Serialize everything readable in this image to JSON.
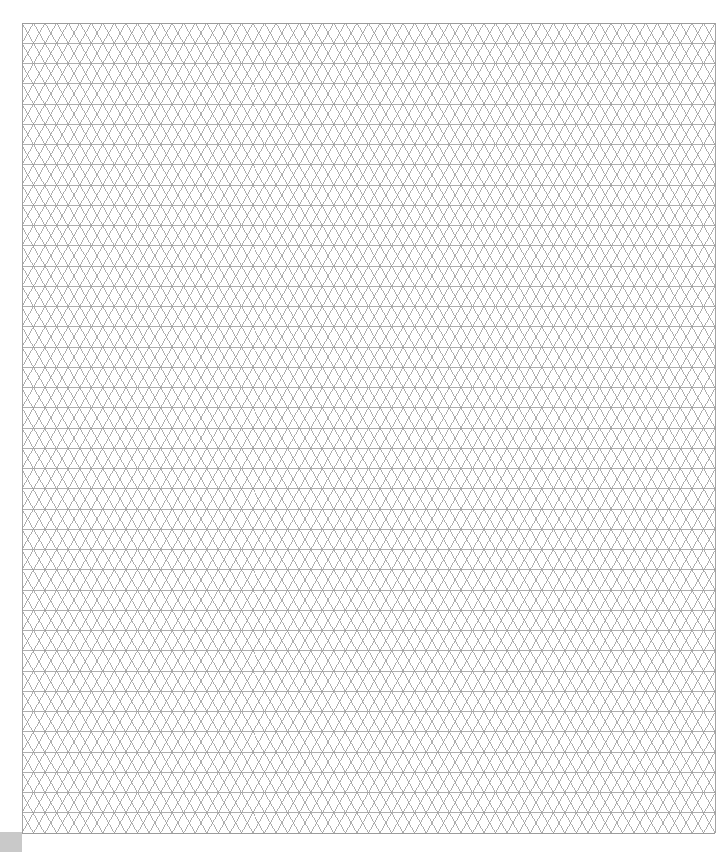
{
  "page": {
    "width": 727,
    "height": 852,
    "background_color": "#ffffff"
  },
  "grid": {
    "name": "isometric-triangular-grid",
    "description": "Triangular (isometric) grid paper formed by horizontal rules and two families of 60-degree diagonals",
    "origin_x": 22,
    "origin_y": 23,
    "width": 693,
    "height": 810,
    "cell_width": 23.1,
    "row_height": 20.25,
    "columns": 30,
    "rows": 40,
    "line_color": "#9a9a9a",
    "line_width": 0.8,
    "border_color": "#9a9a9a",
    "border_width": 0.9,
    "has_horizontal_lines": true,
    "has_left_diagonals": true,
    "has_right_diagonals": true
  },
  "corner_marker": {
    "name": "bottom-left-corner-marker",
    "color": "#c9c9c9",
    "x": 0,
    "y": 832,
    "width": 22,
    "height": 20
  }
}
